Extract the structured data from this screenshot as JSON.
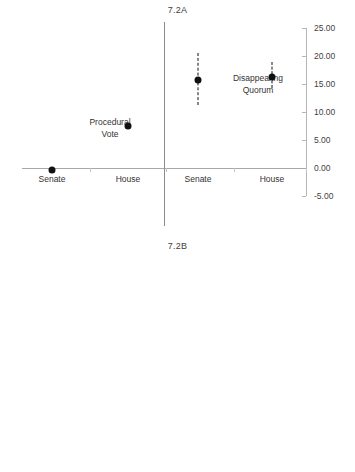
{
  "figure": {
    "panels": [
      {
        "key": "a",
        "title": "7.2A",
        "y_ticks": [
          "25.00",
          "20.00",
          "15.00",
          "10.00",
          "5.00",
          "0.00",
          "-5.00"
        ],
        "x_ticks": [
          "Senate",
          "House",
          "Senate",
          "House"
        ],
        "group_labels": [
          {
            "line1": "Procedural",
            "line2": "Vote"
          },
          {
            "line1": "Disappearing",
            "line2": "Quorum"
          }
        ]
      },
      {
        "key": "b",
        "title": "7.2B",
        "y_ticks": [
          "0.20",
          "0.15",
          "0.10",
          "0.05",
          "0.00",
          "-0.05",
          "-0.10"
        ],
        "x_ticks": [
          "Senate",
          "House",
          "Senate",
          "House"
        ],
        "group_labels": [
          {
            "line1": "Date Rank",
            "line2": ""
          },
          {
            "line1": "Minority Party",
            "line2": "Unity"
          }
        ]
      }
    ]
  },
  "chart_data": [
    {
      "type": "scatter",
      "title": "7.2A",
      "xlabel": "",
      "ylabel": "",
      "ylim": [
        -5.0,
        25.0
      ],
      "ytick_values": [
        25.0,
        20.0,
        15.0,
        10.0,
        5.0,
        0.0,
        -5.0
      ],
      "grid": false,
      "legend": "none",
      "zero_reference_line": 0.0,
      "group_divider": true,
      "categories": [
        "Senate",
        "House",
        "Senate",
        "House"
      ],
      "groups": [
        "Procedural Vote",
        "Procedural Vote",
        "Disappearing Quorum",
        "Disappearing Quorum"
      ],
      "series": [
        {
          "name": "coefficient estimate",
          "points": [
            {
              "group": "Procedural Vote",
              "chamber": "Senate",
              "value": -0.4,
              "ci_low": -0.4,
              "ci_high": -0.4,
              "has_error_bar": false
            },
            {
              "group": "Procedural Vote",
              "chamber": "House",
              "value": 7.5,
              "ci_low": 7.5,
              "ci_high": 7.5,
              "has_error_bar": false
            },
            {
              "group": "Disappearing Quorum",
              "chamber": "Senate",
              "value": 15.8,
              "ci_low": 11.2,
              "ci_high": 20.5,
              "has_error_bar": true
            },
            {
              "group": "Disappearing Quorum",
              "chamber": "House",
              "value": 16.2,
              "ci_low": 14.2,
              "ci_high": 19.0,
              "has_error_bar": true
            }
          ]
        }
      ]
    },
    {
      "type": "scatter",
      "title": "7.2B",
      "xlabel": "",
      "ylabel": "",
      "ylim": [
        -0.1,
        0.2
      ],
      "ytick_values": [
        0.2,
        0.15,
        0.1,
        0.05,
        0.0,
        -0.05,
        -0.1
      ],
      "grid": false,
      "legend": "none",
      "zero_reference_line": 0.0,
      "group_divider": true,
      "categories": [
        "Senate",
        "House",
        "Senate",
        "House"
      ],
      "groups": [
        "Date Rank",
        "Date Rank",
        "Minority Party Unity",
        "Minority Party Unity"
      ],
      "series": [
        {
          "name": "coefficient estimate",
          "points": [
            {
              "group": "Date Rank",
              "chamber": "Senate",
              "value": -0.065,
              "ci_low": -0.076,
              "ci_high": -0.055,
              "has_error_bar": true
            },
            {
              "group": "Date Rank",
              "chamber": "House",
              "value": -0.047,
              "ci_low": -0.057,
              "ci_high": -0.037,
              "has_error_bar": true
            },
            {
              "group": "Minority Party Unity",
              "chamber": "Senate",
              "value": 0.095,
              "ci_low": 0.085,
              "ci_high": 0.106,
              "has_error_bar": true
            },
            {
              "group": "Minority Party Unity",
              "chamber": "House",
              "value": 0.138,
              "ci_low": 0.129,
              "ci_high": 0.148,
              "has_error_bar": true
            }
          ]
        }
      ]
    }
  ]
}
